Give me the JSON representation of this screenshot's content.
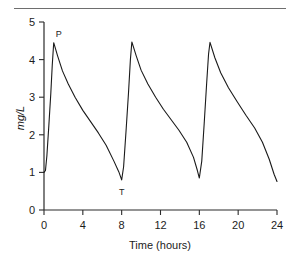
{
  "figure": {
    "name": "drug-concentration-time-plot",
    "has_top_rule": true
  },
  "chart_data": {
    "type": "line",
    "title": "",
    "subtitle": "",
    "xlabel": "Time (hours)",
    "ylabel": "mg/L",
    "xlim": [
      0,
      24
    ],
    "ylim": [
      0,
      5
    ],
    "xticks": [
      0,
      4,
      8,
      12,
      16,
      20,
      24
    ],
    "xtick_labels": [
      "0",
      "4",
      "8",
      "12",
      "16",
      "20",
      "24"
    ],
    "yticks": [
      0,
      1,
      2,
      3,
      4,
      5
    ],
    "ytick_labels": [
      "0",
      "1",
      "2",
      "3",
      "4",
      "5"
    ],
    "grid": false,
    "legend": "none",
    "line_color": "#1a1a1a",
    "annotations": [
      {
        "label": "P",
        "meaning": "peak",
        "x": 1.0,
        "y": 4.45
      },
      {
        "label": "T",
        "meaning": "trough",
        "x": 8.0,
        "y": 0.8
      }
    ],
    "series": [
      {
        "name": "Serum drug concentration",
        "points": [
          [
            0.0,
            1.0
          ],
          [
            0.15,
            1.05
          ],
          [
            0.3,
            1.45
          ],
          [
            0.5,
            2.25
          ],
          [
            0.7,
            3.1
          ],
          [
            0.85,
            3.85
          ],
          [
            1.0,
            4.45
          ],
          [
            1.4,
            4.1
          ],
          [
            1.9,
            3.7
          ],
          [
            2.5,
            3.35
          ],
          [
            3.2,
            3.0
          ],
          [
            4.0,
            2.65
          ],
          [
            4.8,
            2.35
          ],
          [
            5.6,
            2.05
          ],
          [
            6.4,
            1.72
          ],
          [
            7.2,
            1.3
          ],
          [
            7.7,
            1.02
          ],
          [
            8.0,
            0.8
          ],
          [
            8.2,
            1.15
          ],
          [
            8.45,
            2.1
          ],
          [
            8.7,
            3.1
          ],
          [
            8.9,
            4.0
          ],
          [
            9.05,
            4.47
          ],
          [
            9.5,
            4.1
          ],
          [
            10.0,
            3.72
          ],
          [
            10.7,
            3.35
          ],
          [
            11.5,
            3.0
          ],
          [
            12.3,
            2.68
          ],
          [
            13.1,
            2.4
          ],
          [
            13.9,
            2.12
          ],
          [
            14.7,
            1.8
          ],
          [
            15.4,
            1.4
          ],
          [
            15.8,
            1.05
          ],
          [
            16.0,
            0.85
          ],
          [
            16.25,
            1.3
          ],
          [
            16.5,
            2.3
          ],
          [
            16.75,
            3.35
          ],
          [
            16.95,
            4.15
          ],
          [
            17.1,
            4.46
          ],
          [
            17.6,
            4.05
          ],
          [
            18.2,
            3.65
          ],
          [
            19.0,
            3.25
          ],
          [
            19.9,
            2.88
          ],
          [
            20.8,
            2.52
          ],
          [
            21.7,
            2.18
          ],
          [
            22.5,
            1.8
          ],
          [
            23.2,
            1.35
          ],
          [
            23.7,
            0.95
          ],
          [
            24.0,
            0.76
          ]
        ]
      }
    ]
  },
  "axes": {
    "y_axis_name": "concentration-axis",
    "x_axis_name": "time-axis"
  }
}
